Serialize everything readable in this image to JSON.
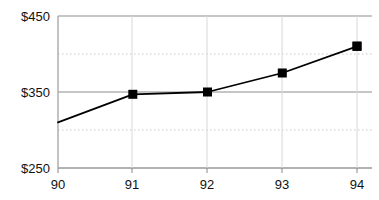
{
  "chart_data": {
    "type": "line",
    "title": "",
    "subtitle": "",
    "xlabel": "",
    "ylabel": "",
    "categories": [
      "90",
      "91",
      "92",
      "93",
      "94"
    ],
    "x": [
      90,
      91,
      92,
      93,
      94
    ],
    "values": [
      310,
      347,
      350,
      375,
      410
    ],
    "series": [
      {
        "name": "",
        "values": [
          310,
          347,
          350,
          375,
          410
        ]
      }
    ],
    "ylim": [
      250,
      450
    ],
    "xlim": [
      90,
      94
    ],
    "y_ticks": [
      250,
      350,
      450
    ],
    "y_tick_labels": [
      "$250",
      "$350",
      "$450"
    ],
    "x_ticks": [
      90,
      91,
      92,
      93,
      94
    ],
    "x_tick_labels": [
      "90",
      "91",
      "92",
      "93",
      "94"
    ],
    "minor_gridlines": [
      300,
      400
    ],
    "grid": true,
    "grid_major_style": "solid",
    "grid_minor_style": "dotted",
    "legend": null,
    "legend_position": "none",
    "annotations": [],
    "marker": "square",
    "line_color": "#000000",
    "marker_color": "#000000",
    "grid_color": "#b3b3b3",
    "minor_grid_color": "#cccccc",
    "axis_color": "#999999",
    "background_color": "#ffffff"
  },
  "axes": {
    "y_labels": [
      "$450",
      "$350",
      "$250"
    ],
    "x_labels": [
      "90",
      "91",
      "92",
      "93",
      "94"
    ]
  }
}
